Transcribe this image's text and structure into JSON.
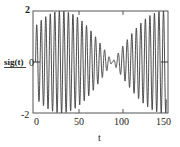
{
  "chart_data": {
    "type": "line",
    "title": "",
    "xlabel": "t",
    "ylabel": "sig(t)",
    "xlim": [
      -3,
      155
    ],
    "ylim": [
      -2,
      2
    ],
    "x_ticks": [
      0,
      50,
      100,
      150
    ],
    "y_ticks": [
      -2,
      0,
      2
    ],
    "y_tick_labels": [
      "-2",
      "0",
      "2"
    ],
    "x_tick_labels": [
      "0",
      "50",
      "100",
      "150"
    ],
    "grid": false,
    "legend": null,
    "series": [
      {
        "name": "sig(t)",
        "description": "beat signal: carrier period ~5.3, envelope 2|cos(pi(t-30)/120)|, max near t=30 and t=150, null near t=90",
        "carrier_period": 5.3,
        "envelope_peak_t": [
          30,
          150
        ],
        "envelope_null_t": 90,
        "amplitude_max": 2,
        "x_start": 0,
        "x_end": 153,
        "color": "#333333"
      }
    ]
  },
  "labels": {
    "ylabel": "sig(t)",
    "xlabel": "t",
    "ytick_top": "2",
    "ytick_mid": "0",
    "ytick_bot": "-2",
    "xtick_0": "0",
    "xtick_50": "50",
    "xtick_100": "100",
    "xtick_150": "150"
  }
}
